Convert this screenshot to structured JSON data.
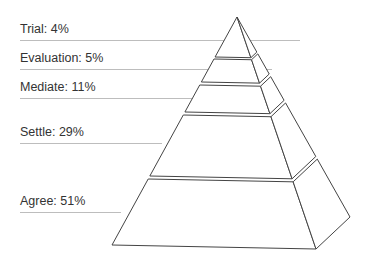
{
  "chart_data": {
    "type": "pyramid",
    "title": "",
    "levels": [
      {
        "name": "Trial",
        "value": 4,
        "label": "Trial: 4%"
      },
      {
        "name": "Evaluation",
        "value": 5,
        "label": "Evaluation: 5%"
      },
      {
        "name": "Mediate",
        "value": 11,
        "label": "Mediate: 11%"
      },
      {
        "name": "Settle",
        "value": 29,
        "label": "Settle: 29%"
      },
      {
        "name": "Agree",
        "value": 51,
        "label": "Agree: 51%"
      }
    ],
    "unit": "%"
  },
  "colors": {
    "text": "#333333",
    "leader": "#bdbdbd",
    "outline": "#444444",
    "fill": "#ffffff"
  }
}
